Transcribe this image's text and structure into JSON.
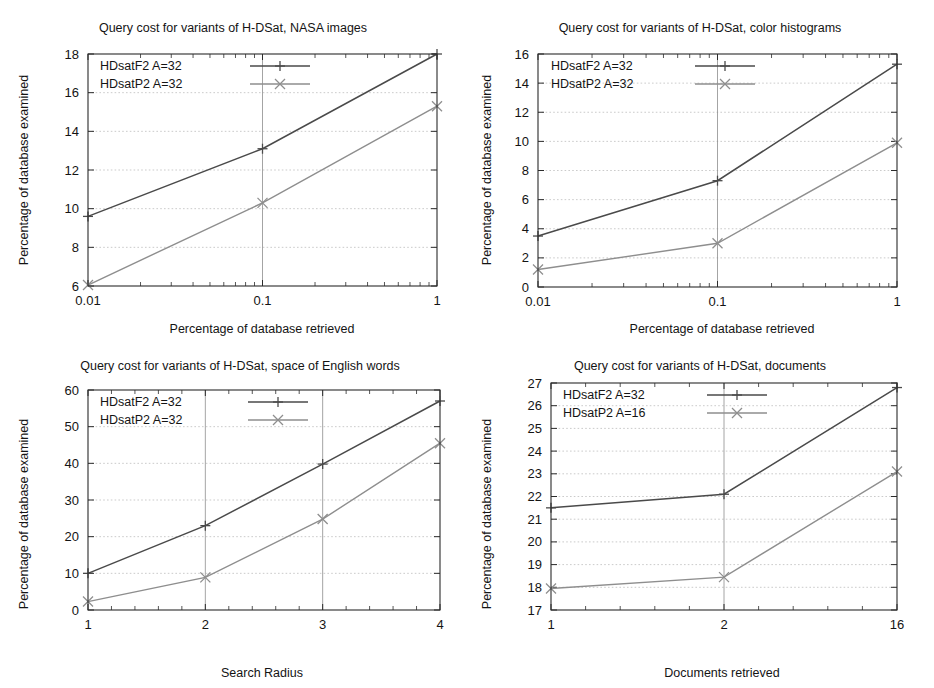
{
  "figure": {
    "background_color": "#ffffff",
    "panel_count": 4,
    "series_colors": {
      "f2": "#4a4a4a",
      "p2": "#8e8e8e"
    }
  },
  "chart_data": [
    {
      "id": "nasa",
      "type": "line",
      "title": "Query cost for variants of H-DSat, NASA images",
      "xlabel": "Percentage of database retrieved",
      "ylabel": "Percentage of database examined",
      "xscale": "log",
      "x": [
        0.01,
        0.1,
        1
      ],
      "xticklabels": [
        "0.01",
        "0.1",
        "1"
      ],
      "xlim": [
        0.01,
        1
      ],
      "ylim": [
        6,
        18
      ],
      "yticks": [
        6,
        8,
        10,
        12,
        14,
        16,
        18
      ],
      "yticklabels": [
        "6",
        "8",
        "10",
        "12",
        "14",
        "16",
        "18"
      ],
      "grid": true,
      "legend_position": "upper left",
      "series": [
        {
          "name": "HDsatF2 A=32",
          "marker": "plus",
          "color": "#4a4a4a",
          "values": [
            9.6,
            13.1,
            18.0
          ]
        },
        {
          "name": "HDsatP2 A=32",
          "marker": "cross",
          "color": "#8e8e8e",
          "values": [
            6.05,
            10.3,
            15.3
          ]
        }
      ]
    },
    {
      "id": "color",
      "type": "line",
      "title": "Query cost for variants of H-DSat, color histograms",
      "xlabel": "Percentage of database retrieved",
      "ylabel": "Percentage of database examined",
      "xscale": "log",
      "x": [
        0.01,
        0.1,
        1
      ],
      "xticklabels": [
        "0.01",
        "0.1",
        "1"
      ],
      "xlim": [
        0.01,
        1
      ],
      "ylim": [
        0,
        16
      ],
      "yticks": [
        0,
        2,
        4,
        6,
        8,
        10,
        12,
        14,
        16
      ],
      "yticklabels": [
        "0",
        "2",
        "4",
        "6",
        "8",
        "10",
        "12",
        "14",
        "16"
      ],
      "grid": true,
      "legend_position": "upper left",
      "series": [
        {
          "name": "HDsatF2 A=32",
          "marker": "plus",
          "color": "#4a4a4a",
          "values": [
            3.5,
            7.3,
            15.3
          ]
        },
        {
          "name": "HDsatP2 A=32",
          "marker": "cross",
          "color": "#8e8e8e",
          "values": [
            1.2,
            3.0,
            9.9
          ]
        }
      ]
    },
    {
      "id": "english",
      "type": "line",
      "title": "Query cost for variants of H-DSat, space of English words",
      "xlabel": "Search Radius",
      "ylabel": "Percentage of database examined",
      "xscale": "linear",
      "x": [
        1,
        2,
        3,
        4
      ],
      "xticklabels": [
        "1",
        "2",
        "3",
        "4"
      ],
      "xlim": [
        1,
        4
      ],
      "ylim": [
        0,
        60
      ],
      "yticks": [
        0,
        10,
        20,
        30,
        40,
        50,
        60
      ],
      "yticklabels": [
        "0",
        "10",
        "20",
        "30",
        "40",
        "50",
        "60"
      ],
      "grid": true,
      "legend_position": "upper left",
      "series": [
        {
          "name": "HDsatF2 A=32",
          "marker": "plus",
          "color": "#4a4a4a",
          "values": [
            10.0,
            23.0,
            39.8,
            57.0
          ]
        },
        {
          "name": "HDsatP2 A=32",
          "marker": "cross",
          "color": "#8e8e8e",
          "values": [
            2.3,
            8.9,
            24.8,
            45.5
          ]
        }
      ]
    },
    {
      "id": "docs",
      "type": "line",
      "title": "Query cost for variants of H-DSat, documents",
      "xlabel": "Documents retrieved",
      "ylabel": "Percentage of database examined",
      "xscale": "categorical",
      "x": [
        1,
        2,
        16
      ],
      "xticklabels": [
        "1",
        "2",
        "16"
      ],
      "ylim": [
        17,
        27
      ],
      "yticks": [
        17,
        18,
        19,
        20,
        21,
        22,
        23,
        24,
        25,
        26,
        27
      ],
      "yticklabels": [
        "17",
        "18",
        "19",
        "20",
        "21",
        "22",
        "23",
        "24",
        "25",
        "26",
        "27"
      ],
      "grid": true,
      "legend_position": "upper left",
      "series": [
        {
          "name": "HDsatF2 A=32",
          "marker": "plus",
          "color": "#4a4a4a",
          "values": [
            21.5,
            22.1,
            26.8
          ]
        },
        {
          "name": "HDsatP2 A=16",
          "marker": "cross",
          "color": "#8e8e8e",
          "values": [
            17.95,
            18.45,
            23.1
          ]
        }
      ]
    }
  ]
}
